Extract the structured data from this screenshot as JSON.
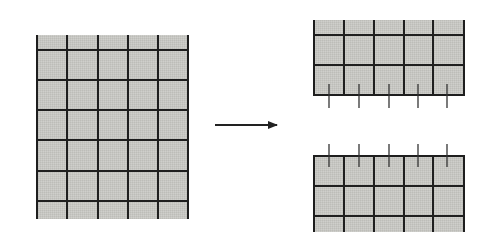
{
  "diagram": {
    "colors": {
      "background": "#ffffff",
      "cell_fill": "#c6c6c2",
      "line": "#1e1e1e",
      "arrow": "#222222"
    },
    "left_grid": {
      "x": 37,
      "y": 35,
      "width": 151,
      "height": 184,
      "columns": 5,
      "vertical_lines_x": [
        37,
        67,
        98,
        128,
        158,
        188
      ],
      "horizontal_lines_y": [
        50,
        80,
        110,
        140,
        171,
        201
      ],
      "top_border": false,
      "bottom_border": false
    },
    "arrow": {
      "x1": 215,
      "y1": 125,
      "x2": 277,
      "y2": 125,
      "direction": "right"
    },
    "top_right_grid": {
      "x": 314,
      "y": 20,
      "width": 150,
      "height": 76,
      "vertical_lines_x": [
        314,
        344,
        374,
        404,
        433,
        464
      ],
      "horizontal_lines_y": [
        35,
        65,
        95
      ],
      "top_border": false,
      "bottom_border": true,
      "ticks": {
        "x": [
          329,
          359,
          389,
          418,
          447
        ],
        "y1": 84,
        "y2": 108
      }
    },
    "bottom_right_grid": {
      "x": 314,
      "y": 156,
      "width": 150,
      "height": 76,
      "vertical_lines_x": [
        314,
        344,
        374,
        404,
        433,
        464
      ],
      "horizontal_lines_y": [
        156,
        186,
        216
      ],
      "top_border": true,
      "bottom_border": false,
      "ticks": {
        "x": [
          329,
          359,
          389,
          418,
          447
        ],
        "y1": 144,
        "y2": 167
      }
    }
  }
}
